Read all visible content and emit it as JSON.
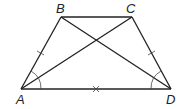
{
  "figure": {
    "type": "isosceles trapezoid with diagonals",
    "vertices": {
      "A": {
        "label": "A",
        "x": 21,
        "y": 89
      },
      "B": {
        "label": "B",
        "x": 61,
        "y": 17
      },
      "C": {
        "label": "C",
        "x": 132,
        "y": 17
      },
      "D": {
        "label": "D",
        "x": 171,
        "y": 89
      }
    },
    "segments": [
      "AB",
      "BC",
      "CD",
      "AD",
      "AC",
      "BD"
    ],
    "markings": {
      "equal_tick_single": [
        "AB",
        "CD"
      ],
      "cross_mark": [
        "AD"
      ],
      "angle_arcs": [
        "A",
        "D"
      ]
    },
    "colors": {
      "stroke": "#222222",
      "background": "#ffffff"
    }
  }
}
